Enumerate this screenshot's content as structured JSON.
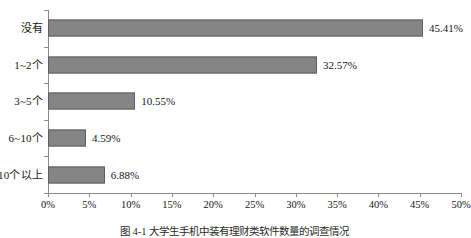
{
  "chart_data": {
    "type": "bar",
    "orientation": "horizontal",
    "title": "",
    "xlabel": "",
    "ylabel": "",
    "categories": [
      "没有",
      "1~2个",
      "3~5个",
      "6~10个",
      "10个以上"
    ],
    "values": [
      45.41,
      32.57,
      10.55,
      4.59,
      6.88
    ],
    "value_labels": [
      "45.41%",
      "32.57%",
      "10.55%",
      "4.59%",
      "6.88%"
    ],
    "xlim": [
      0,
      50
    ],
    "xtick_values": [
      0,
      5,
      10,
      15,
      20,
      25,
      30,
      35,
      40,
      45,
      50
    ],
    "xtick_labels": [
      "0%",
      "5%",
      "10%",
      "15%",
      "20%",
      "25%",
      "30%",
      "35%",
      "40%",
      "45%",
      "50%"
    ],
    "grid": false,
    "legend": false,
    "series": [
      {
        "name": "",
        "values": [
          45.41,
          32.57,
          10.55,
          4.59,
          6.88
        ]
      }
    ],
    "colors": {
      "bar_fill": "#858585",
      "bar_border": "#5e5e5e",
      "axis": "#8a8a8a",
      "text": "#161616",
      "background": "#ffffff"
    }
  },
  "caption": {
    "text": "图 4-1  大学生手机中装有理财类软件数量的调查情况"
  }
}
